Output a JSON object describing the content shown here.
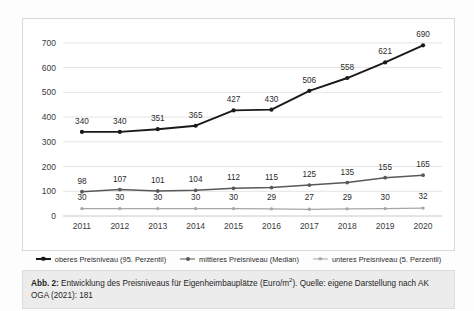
{
  "chart_data": {
    "type": "line",
    "title": "",
    "xlabel": "",
    "ylabel": "",
    "ylim": [
      0,
      740
    ],
    "yticks": [
      0,
      100,
      200,
      300,
      400,
      500,
      600,
      700
    ],
    "grid": true,
    "legend_position": "bottom",
    "categories": [
      "2011",
      "2012",
      "2013",
      "2014",
      "2015",
      "2016",
      "2017",
      "2018",
      "2019",
      "2020"
    ],
    "series": [
      {
        "name": "oberes Preisniveau (95. Perzentil)",
        "color": "#1a1a1a",
        "marker": "circle",
        "values": [
          340,
          340,
          351,
          365,
          427,
          430,
          506,
          558,
          621,
          690
        ],
        "labels": [
          "340",
          "340",
          "351",
          "365",
          "427",
          "430",
          "506",
          "558",
          "621",
          "690"
        ]
      },
      {
        "name": "mittleres Preisniveau (Median)",
        "color": "#595959",
        "marker": "circle",
        "values": [
          98,
          107,
          101,
          104,
          112,
          115,
          125,
          135,
          155,
          165
        ],
        "labels": [
          "98",
          "107",
          "101",
          "104",
          "112",
          "115",
          "125",
          "135",
          "155",
          "165"
        ]
      },
      {
        "name": "unteres Preisniveau (5. Perzentil)",
        "color": "#a6a6a6",
        "marker": "circle",
        "values": [
          30,
          30,
          30,
          30,
          30,
          29,
          27,
          29,
          30,
          32
        ],
        "labels": [
          "30",
          "30",
          "30",
          "30",
          "30",
          "29",
          "27",
          "29",
          "30",
          "32"
        ]
      }
    ]
  },
  "legend": {
    "items": [
      {
        "label": "oberes Preisniveau (95. Perzentil)",
        "color": "#1a1a1a"
      },
      {
        "label": "mittleres Preisniveau (Median)",
        "color": "#595959"
      },
      {
        "label": "unteres Preisniveau (5. Perzentil)",
        "color": "#a6a6a6"
      }
    ]
  },
  "caption": {
    "lead": "Abb. 2:",
    "text_before_unit": " Entwicklung des Preisniveaus für Eigenheimbauplätze (Euro/m",
    "unit_exponent": "2",
    "text_after_unit": "). Quelle: eigene Darstellung nach AK OGA (2021): 181"
  },
  "colors": {
    "upper_series": "#1a1a1a",
    "median_series": "#595959",
    "lower_series": "#a6a6a6",
    "gridline": "#e3e3e3",
    "caption_background": "#ececec",
    "chart_border": "#d8d8d8"
  }
}
